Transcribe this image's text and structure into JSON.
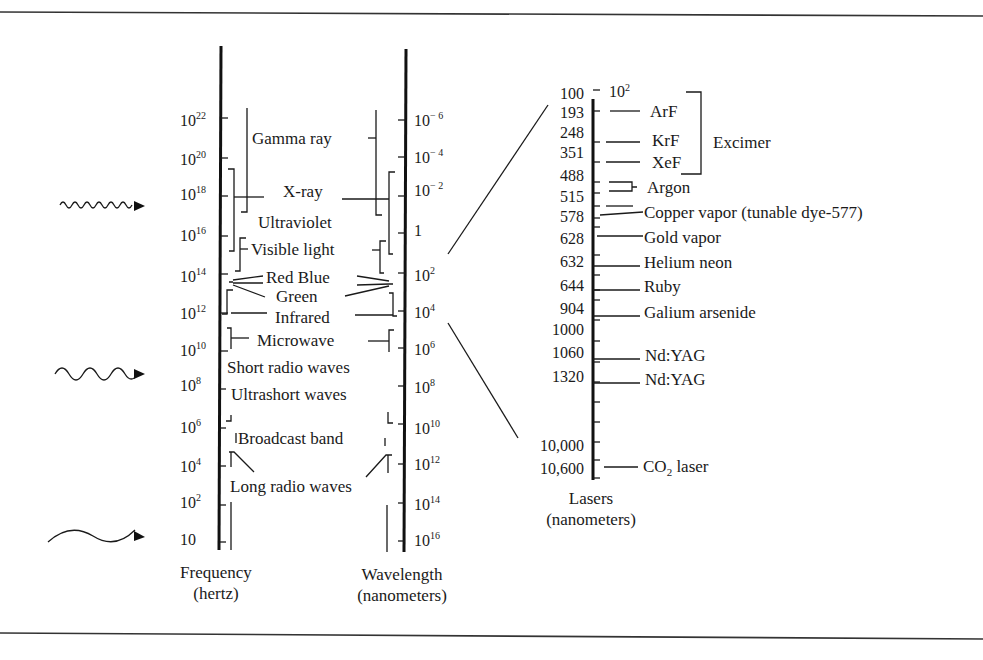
{
  "frequency_axis": {
    "title": "Frequency",
    "unit": "(hertz)",
    "ticks": [
      {
        "base": "10",
        "exp": "22"
      },
      {
        "base": "10",
        "exp": "20"
      },
      {
        "base": "10",
        "exp": "18"
      },
      {
        "base": "10",
        "exp": "16"
      },
      {
        "base": "10",
        "exp": "14"
      },
      {
        "base": "10",
        "exp": "12"
      },
      {
        "base": "10",
        "exp": "10"
      },
      {
        "base": "10",
        "exp": "8"
      },
      {
        "base": "10",
        "exp": "6"
      },
      {
        "base": "10",
        "exp": "4"
      },
      {
        "base": "10",
        "exp": "2"
      },
      {
        "base": "10",
        "exp": ""
      }
    ]
  },
  "wavelength_axis": {
    "title": "Wavelength",
    "unit": "(nanometers)",
    "ticks": [
      {
        "base": "10",
        "exp": "− 6"
      },
      {
        "base": "10",
        "exp": "− 4"
      },
      {
        "base": "10",
        "exp": "− 2"
      },
      {
        "base": "1",
        "exp": ""
      },
      {
        "base": "10",
        "exp": "2"
      },
      {
        "base": "10",
        "exp": "4"
      },
      {
        "base": "10",
        "exp": "6"
      },
      {
        "base": "10",
        "exp": "8"
      },
      {
        "base": "10",
        "exp": "10"
      },
      {
        "base": "10",
        "exp": "12"
      },
      {
        "base": "10",
        "exp": "14"
      },
      {
        "base": "10",
        "exp": "16"
      }
    ]
  },
  "bands": [
    "Gamma ray",
    "X-ray",
    "Ultraviolet",
    "Visible light",
    "Red Blue",
    "Green",
    "Infrared",
    "Microwave",
    "Short radio waves",
    "Ultrashort waves",
    "Broadcast band",
    "Long radio waves"
  ],
  "wave_icons": [
    "short-wave",
    "medium-wave",
    "long-wave"
  ],
  "laser_axis": {
    "title": "Lasers",
    "unit": "(nanometers)",
    "top_label": {
      "base": "10",
      "exp": "2"
    },
    "values": [
      "100",
      "193",
      "248",
      "351",
      "488",
      "515",
      "578",
      "628",
      "632",
      "644",
      "904",
      "1000",
      "1060",
      "1320",
      "10,000",
      "10,600"
    ],
    "lasers": [
      {
        "name": "ArF",
        "wavelength": "193"
      },
      {
        "name": "KrF",
        "wavelength": "248"
      },
      {
        "name": "XeF",
        "wavelength": "351"
      },
      {
        "name": "Argon",
        "wavelength": "488, 515"
      },
      {
        "name": "Copper vapor (tunable dye-577)",
        "wavelength": "578"
      },
      {
        "name": "Gold vapor",
        "wavelength": "628"
      },
      {
        "name": "Helium neon",
        "wavelength": "632"
      },
      {
        "name": "Ruby",
        "wavelength": "644"
      },
      {
        "name": "Galium arsenide",
        "wavelength": "904"
      },
      {
        "name": "Nd:YAG",
        "wavelength": "1060"
      },
      {
        "name": "Nd:YAG",
        "wavelength": "1320"
      },
      {
        "name": "CO2 laser",
        "wavelength": "10,600"
      }
    ],
    "group_label": "Excimer",
    "co2_label": {
      "main": "CO",
      "sub": "2",
      "rest": " laser"
    }
  }
}
